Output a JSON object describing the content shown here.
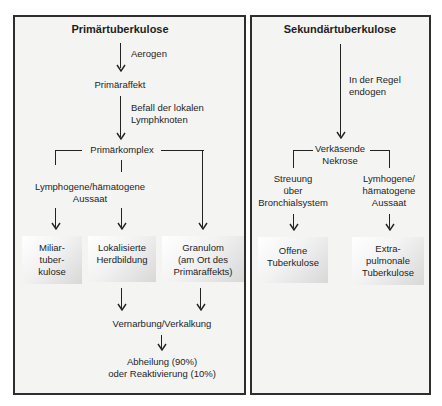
{
  "primary": {
    "title": "Primärtuberkulose",
    "step1_label": "Aerogen",
    "node1": "Primäraffekt",
    "step2_label_line1": "Befall der lokalen",
    "step2_label_line2": "Lymphknoten",
    "node2": "Primärkomplex",
    "branch_label_line1": "Lymphogene/hämatogene",
    "branch_label_line2": "Aussaat",
    "outcomes": [
      {
        "lines": [
          "Miliar-",
          "tuber-",
          "kulose"
        ]
      },
      {
        "lines": [
          "Lokalisierte",
          "Herdbildung"
        ]
      },
      {
        "lines": [
          "Granulom",
          "(am Ort des",
          "Primäraffekts)"
        ]
      }
    ],
    "node3": "Vernarbung/Verkalkung",
    "final_line1": "Abheilung (90%)",
    "final_line2": "oder Reaktivierung (10%)"
  },
  "secondary": {
    "title": "Sekundärtuberkulose",
    "step1_label_line1": "In der Regel",
    "step1_label_line2": "endogen",
    "node1_line1": "Verkäsende",
    "node1_line2": "Nekrose",
    "left_branch": [
      "Streuung",
      "über",
      "Bronchialsystem"
    ],
    "right_branch": [
      "Lymhogene/",
      "hämatogene",
      "Aussaat"
    ],
    "outcomes": [
      {
        "lines": [
          "Offene",
          "Tuberkulose"
        ]
      },
      {
        "lines": [
          "Extra-",
          "pulmonale",
          "Tuberkulose"
        ]
      }
    ]
  }
}
